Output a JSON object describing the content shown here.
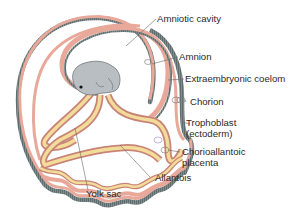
{
  "diagram": {
    "type": "anatomical-illustration",
    "labels": {
      "amniotic_cavity": "Amniotic cavity",
      "amnion": "Amnion",
      "extraembryonic_coelom": "Extraembryonic coelom",
      "chorion": "Chorion",
      "trophoblast_line1": "Trophoblast",
      "trophoblast_line2": "(ectoderm)",
      "chorioallantoic_line1": "Chorioallantoic",
      "chorioallantoic_line2": "placenta",
      "allantois": "Allantois",
      "yolk_sac": "Yolk sac"
    },
    "colors": {
      "trophoblast": "#6f7f80",
      "mesoderm_pink": "#e8a99a",
      "pink_dark": "#c98478",
      "endoderm_yellow": "#f3dc9a",
      "embryo": "#b9bec3",
      "leader_line": "#555555",
      "text": "#2a2a2a"
    }
  }
}
